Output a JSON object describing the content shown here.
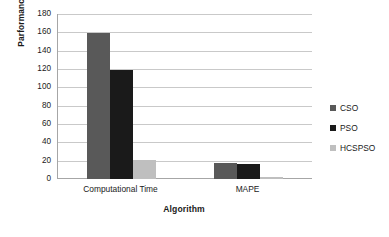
{
  "chart_data": {
    "type": "bar",
    "title": "",
    "subtitle": "",
    "xlabel": "Algorithm",
    "ylabel": "Parformance metrics",
    "categories": [
      "Computational Time",
      "MAPE"
    ],
    "series": [
      {
        "name": "CSO",
        "values": [
          159,
          18
        ],
        "color": "#595959"
      },
      {
        "name": "PSO",
        "values": [
          119,
          16
        ],
        "color": "#1a1a1a"
      },
      {
        "name": "HCSPSO",
        "values": [
          21,
          2
        ],
        "color": "#bfbfbf"
      }
    ],
    "ylim": [
      0,
      180
    ],
    "ytick_step": 20,
    "yticks": [
      "180",
      "160",
      "140",
      "120",
      "100",
      "80",
      "60",
      "40",
      "20",
      "0"
    ],
    "grid": "horizontal",
    "legend_position": "right",
    "background": "#ffffff",
    "gridline_color": "#c9c9c9",
    "axis_color": "#a6a6a6"
  }
}
